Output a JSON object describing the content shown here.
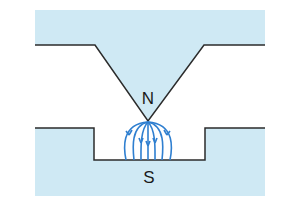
{
  "diagram": {
    "labels": {
      "north": "N",
      "south": "S"
    },
    "colors": {
      "magnet_fill": "#cfe9f4",
      "outline": "#2b2b2b",
      "field_lines": "#2f7fd0",
      "background": "#ffffff"
    },
    "field_lines": {
      "count": 7,
      "direction": "N to S"
    }
  }
}
